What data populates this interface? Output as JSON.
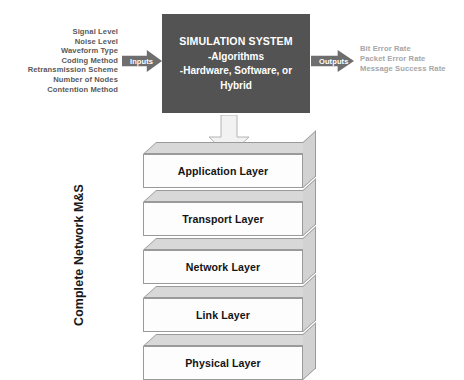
{
  "diagram": {
    "inputs": {
      "arrow_label": "Inputs",
      "items": [
        "Signal Level",
        "Noise Level",
        "Waveform Type",
        "Coding Method",
        "Retransmission Scheme",
        "Number of Nodes",
        "Contention Method"
      ]
    },
    "simulation": {
      "title": "SIMULATION SYSTEM",
      "line2": "-Algorithms",
      "line3": "-Hardware, Software, or",
      "line4": "Hybrid"
    },
    "outputs": {
      "arrow_label": "Outputs",
      "items": [
        "Bit Error Rate",
        "Packet Error Rate",
        "Message Success Rate"
      ]
    },
    "stack": {
      "label": "Complete Network M&S",
      "layers": [
        {
          "name": "Application Layer"
        },
        {
          "name": "Transport Layer"
        },
        {
          "name": "Network Layer"
        },
        {
          "name": "Link Layer"
        },
        {
          "name": "Physical Layer"
        }
      ]
    },
    "colors": {
      "simulation_box": "#535353",
      "arrow_gray": "#6e6e6e",
      "layer_top": "#d8d8d8",
      "layer_front": "#fdfdfd",
      "outputs_text": "#a6a6a6",
      "inputs_text": "#5a5a5a"
    }
  }
}
